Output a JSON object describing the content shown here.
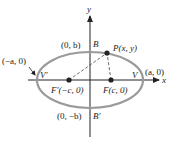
{
  "diagram": {
    "type": "ellipse-coordinate-diagram",
    "colors": {
      "ellipse": "#9a9a9a",
      "axes": "#222222",
      "points": "#222222",
      "dashed": "#444444",
      "background": "#ffffff"
    },
    "axes": {
      "x_label": "x",
      "y_label": "y"
    },
    "labels": {
      "vertex_left_coord": "(−a, 0)",
      "vertex_left_name": "V′",
      "vertex_right_coord": "(a, 0)",
      "vertex_right_name": "V",
      "covertex_top_coord": "(0, b)",
      "covertex_top_name": "B",
      "covertex_bottom_coord": "(0, −b)",
      "covertex_bottom_name": "B′",
      "focus_left": "F′(−c, 0)",
      "focus_right": "F(c, 0)",
      "point_p": "P(x, y)"
    }
  }
}
